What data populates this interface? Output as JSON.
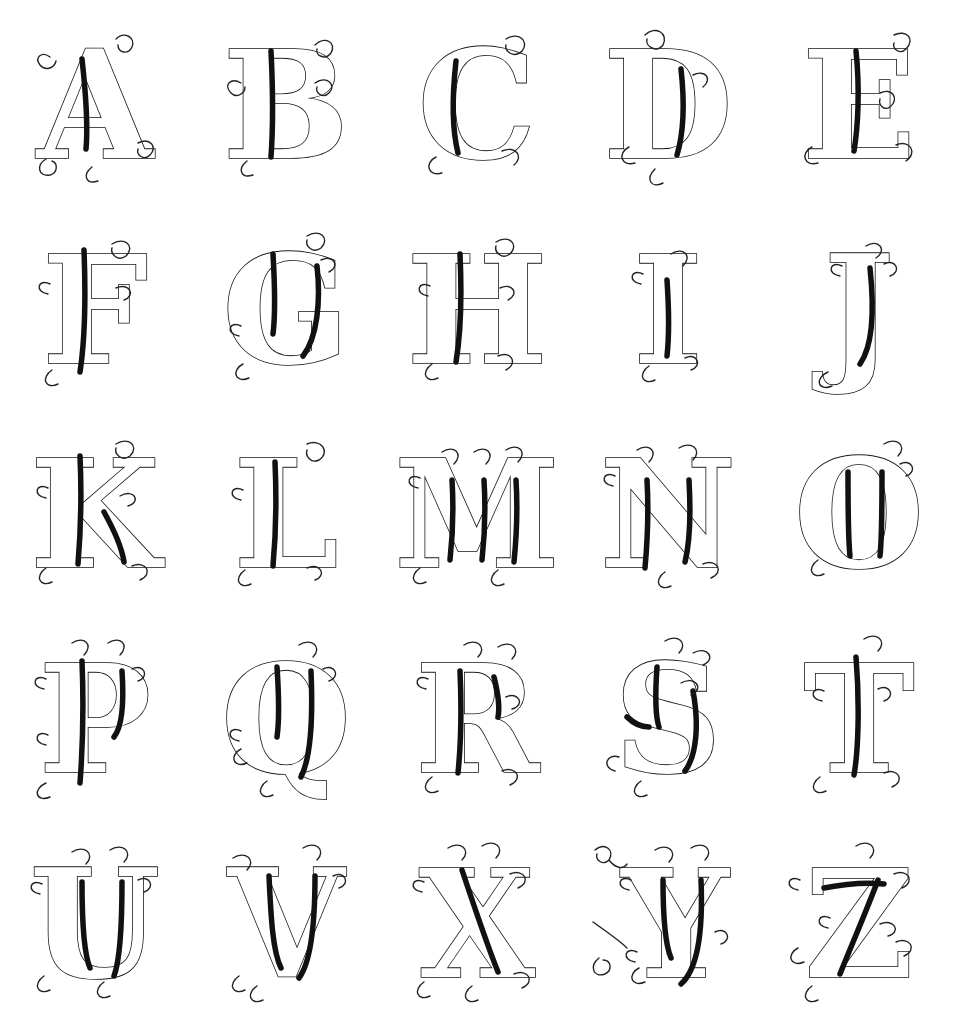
{
  "page": {
    "kind": "alphabet-specimen-sheet",
    "title": "Ornamental Blackletter Alphabet",
    "style_name": "Old English / Gothic outlined capitals",
    "background_color": "#ffffff",
    "ink_color": "#111111",
    "width_px": 954,
    "height_px": 1023,
    "columns": 5,
    "rows": 5,
    "letter_count": 25,
    "omitted_letters": "W"
  },
  "grid": {
    "rows": [
      {
        "index": 1,
        "cells": [
          {
            "letter": "A",
            "name": "letter-a",
            "center_x": 101,
            "center_y": 113
          },
          {
            "letter": "B",
            "name": "letter-b",
            "center_x": 288,
            "center_y": 108
          },
          {
            "letter": "C",
            "name": "letter-c",
            "center_x": 486,
            "center_y": 106
          },
          {
            "letter": "D",
            "name": "letter-d",
            "center_x": 679,
            "center_y": 105
          },
          {
            "letter": "E",
            "name": "letter-e",
            "center_x": 869,
            "center_y": 110
          }
        ]
      },
      {
        "index": 2,
        "cells": [
          {
            "letter": "F",
            "name": "letter-f",
            "center_x": 104,
            "center_y": 312
          },
          {
            "letter": "G",
            "name": "letter-g",
            "center_x": 290,
            "center_y": 317
          },
          {
            "letter": "H",
            "name": "letter-h",
            "center_x": 483,
            "center_y": 312
          },
          {
            "letter": "I",
            "name": "letter-i",
            "center_x": 668,
            "center_y": 322
          },
          {
            "letter": "J",
            "name": "letter-j",
            "center_x": 868,
            "center_y": 325
          }
        ]
      },
      {
        "index": 3,
        "cells": [
          {
            "letter": "K",
            "name": "letter-k",
            "center_x": 95,
            "center_y": 506
          },
          {
            "letter": "L",
            "name": "letter-l",
            "center_x": 283,
            "center_y": 501
          },
          {
            "letter": "M",
            "name": "letter-m",
            "center_x": 484,
            "center_y": 505
          },
          {
            "letter": "N",
            "name": "letter-n",
            "center_x": 672,
            "center_y": 503
          },
          {
            "letter": "O",
            "name": "letter-o",
            "center_x": 868,
            "center_y": 503
          }
        ]
      },
      {
        "index": 4,
        "cells": [
          {
            "letter": "P",
            "name": "letter-p",
            "center_x": 98,
            "center_y": 703
          },
          {
            "letter": "Q",
            "name": "letter-q",
            "center_x": 283,
            "center_y": 705
          },
          {
            "letter": "R",
            "name": "letter-r",
            "center_x": 484,
            "center_y": 700
          },
          {
            "letter": "S",
            "name": "letter-s",
            "center_x": 682,
            "center_y": 700
          },
          {
            "letter": "T",
            "name": "letter-t",
            "center_x": 866,
            "center_y": 700
          }
        ]
      },
      {
        "index": 5,
        "cells": [
          {
            "letter": "U",
            "name": "letter-u",
            "center_x": 98,
            "center_y": 900
          },
          {
            "letter": "V",
            "name": "letter-v",
            "center_x": 285,
            "center_y": 900
          },
          {
            "letter": "X",
            "name": "letter-x",
            "center_x": 484,
            "center_y": 900
          },
          {
            "letter": "Y",
            "name": "letter-y",
            "center_x": 686,
            "center_y": 898
          },
          {
            "letter": "Z",
            "name": "letter-z",
            "center_x": 876,
            "center_y": 898
          }
        ]
      }
    ]
  },
  "flourish": {
    "note": "detached ornamental curls at left of the Y cell",
    "count": 2
  }
}
